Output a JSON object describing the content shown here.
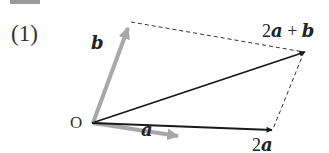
{
  "problem": {
    "part_label": "(1)",
    "origin_label": "O"
  },
  "vectors": {
    "a": {
      "label": "a",
      "color": "#a8a8a8",
      "style": "thick-gray-arrow"
    },
    "b": {
      "label": "b",
      "color": "#a8a8a8",
      "style": "thick-gray-arrow"
    },
    "two_a": {
      "coef": "2",
      "name": "a",
      "color": "#1a1a1a",
      "style": "black-arrow"
    },
    "sum": {
      "coef": "2",
      "name_a": "a",
      "plus": " + ",
      "name_b": "b",
      "color": "#1a1a1a",
      "style": "black-arrow"
    }
  },
  "construction": {
    "parallelogram_sides": "dashed",
    "dash_color": "#333333"
  }
}
